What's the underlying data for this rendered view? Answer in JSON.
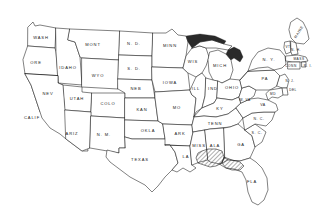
{
  "map": {
    "title": "United States Outline Map",
    "background_color": "#ffffff",
    "outline_color": "#1a1a1a",
    "hatch_color": "#1a1a1a",
    "projection_note": "contiguous United States, state boundaries",
    "highlight": {
      "name": "gulf-coast-hatched-region",
      "pattern": "diagonal-hatch",
      "covers": [
        "southern Mississippi",
        "southern Alabama",
        "Florida panhandle"
      ],
      "color": "#1a1a1a"
    },
    "states": [
      {
        "id": "wash",
        "label": "WASH",
        "x": 41,
        "y": 38,
        "size": "normal"
      },
      {
        "id": "ore",
        "label": "ORE",
        "x": 36,
        "y": 63,
        "size": "normal"
      },
      {
        "id": "idaho",
        "label": "IDAHO",
        "x": 68,
        "y": 68,
        "size": "normal"
      },
      {
        "id": "mont",
        "label": "MONT",
        "x": 93,
        "y": 45,
        "size": "normal"
      },
      {
        "id": "wyo",
        "label": "WYO",
        "x": 98,
        "y": 76,
        "size": "normal"
      },
      {
        "id": "nev",
        "label": "NEV",
        "x": 48,
        "y": 94,
        "size": "normal"
      },
      {
        "id": "utah",
        "label": "UTAH",
        "x": 77,
        "y": 99,
        "size": "normal"
      },
      {
        "id": "colo",
        "label": "COLO",
        "x": 108,
        "y": 104,
        "size": "normal"
      },
      {
        "id": "calif",
        "label": "CALIF",
        "x": 32,
        "y": 118,
        "size": "normal"
      },
      {
        "id": "ariz",
        "label": "ARIZ",
        "x": 72,
        "y": 134,
        "size": "normal"
      },
      {
        "id": "nm",
        "label": "N. M.",
        "x": 104,
        "y": 135,
        "size": "normal"
      },
      {
        "id": "nd",
        "label": "N. D.",
        "x": 134,
        "y": 44,
        "size": "normal"
      },
      {
        "id": "sd",
        "label": "S. D.",
        "x": 134,
        "y": 69,
        "size": "normal"
      },
      {
        "id": "neb",
        "label": "NEB",
        "x": 136,
        "y": 89,
        "size": "normal"
      },
      {
        "id": "kan",
        "label": "KAN",
        "x": 142,
        "y": 110,
        "size": "normal"
      },
      {
        "id": "okla",
        "label": "OKLA",
        "x": 148,
        "y": 131,
        "size": "normal"
      },
      {
        "id": "texas",
        "label": "TEXAS",
        "x": 140,
        "y": 160,
        "size": "normal"
      },
      {
        "id": "minn",
        "label": "MINN",
        "x": 170,
        "y": 46,
        "size": "normal"
      },
      {
        "id": "iowa",
        "label": "IOWA",
        "x": 170,
        "y": 83,
        "size": "normal"
      },
      {
        "id": "mo",
        "label": "MO",
        "x": 177,
        "y": 108,
        "size": "normal"
      },
      {
        "id": "ark",
        "label": "ARK",
        "x": 180,
        "y": 134,
        "size": "normal"
      },
      {
        "id": "la",
        "label": "LA",
        "x": 186,
        "y": 157,
        "size": "normal"
      },
      {
        "id": "wis",
        "label": "WIS",
        "x": 193,
        "y": 62,
        "size": "normal"
      },
      {
        "id": "ill",
        "label": "ILL",
        "x": 196,
        "y": 89,
        "size": "normal"
      },
      {
        "id": "mich",
        "label": "MICH",
        "x": 220,
        "y": 66,
        "size": "normal"
      },
      {
        "id": "ind",
        "label": "IND",
        "x": 213,
        "y": 89,
        "size": "normal"
      },
      {
        "id": "ohio",
        "label": "OHIO",
        "x": 232,
        "y": 88,
        "size": "normal"
      },
      {
        "id": "ky",
        "label": "KY",
        "x": 220,
        "y": 109,
        "size": "normal"
      },
      {
        "id": "tenn",
        "label": "TENN",
        "x": 215,
        "y": 124,
        "size": "normal"
      },
      {
        "id": "miss",
        "label": "MISS",
        "x": 199,
        "y": 146,
        "size": "normal"
      },
      {
        "id": "ala",
        "label": "ALA",
        "x": 215,
        "y": 146,
        "size": "normal"
      },
      {
        "id": "ga",
        "label": "GA",
        "x": 241,
        "y": 145,
        "size": "normal"
      },
      {
        "id": "fla",
        "label": "FLA",
        "x": 252,
        "y": 182,
        "size": "normal"
      },
      {
        "id": "sc",
        "label": "S. C.",
        "x": 257,
        "y": 133,
        "size": "small"
      },
      {
        "id": "nc",
        "label": "N. C.",
        "x": 259,
        "y": 119,
        "size": "small"
      },
      {
        "id": "va",
        "label": "VA",
        "x": 263,
        "y": 105,
        "size": "small"
      },
      {
        "id": "wva",
        "label": "W. VA",
        "x": 245,
        "y": 100,
        "size": "tiny"
      },
      {
        "id": "pa",
        "label": "PA",
        "x": 265,
        "y": 79,
        "size": "normal"
      },
      {
        "id": "ny",
        "label": "N. Y.",
        "x": 269,
        "y": 60,
        "size": "normal"
      },
      {
        "id": "vt",
        "label": "VT",
        "x": 288,
        "y": 47,
        "size": "tiny"
      },
      {
        "id": "nh",
        "label": "N. H.",
        "x": 295,
        "y": 50,
        "size": "tiny"
      },
      {
        "id": "maine",
        "label": "MAINE",
        "x": 299,
        "y": 32,
        "size": "small"
      },
      {
        "id": "mass",
        "label": "MASS",
        "x": 299,
        "y": 60,
        "size": "tiny"
      },
      {
        "id": "ri",
        "label": "R. I.",
        "x": 305,
        "y": 66,
        "size": "tiny"
      },
      {
        "id": "conn",
        "label": "CONN",
        "x": 291,
        "y": 66,
        "size": "tiny"
      },
      {
        "id": "nj",
        "label": "N. J.",
        "x": 285,
        "y": 81,
        "size": "tiny"
      },
      {
        "id": "del",
        "label": "DEL",
        "x": 286,
        "y": 89,
        "size": "tiny"
      },
      {
        "id": "md",
        "label": "MD",
        "x": 279,
        "y": 94,
        "size": "tiny"
      }
    ]
  }
}
